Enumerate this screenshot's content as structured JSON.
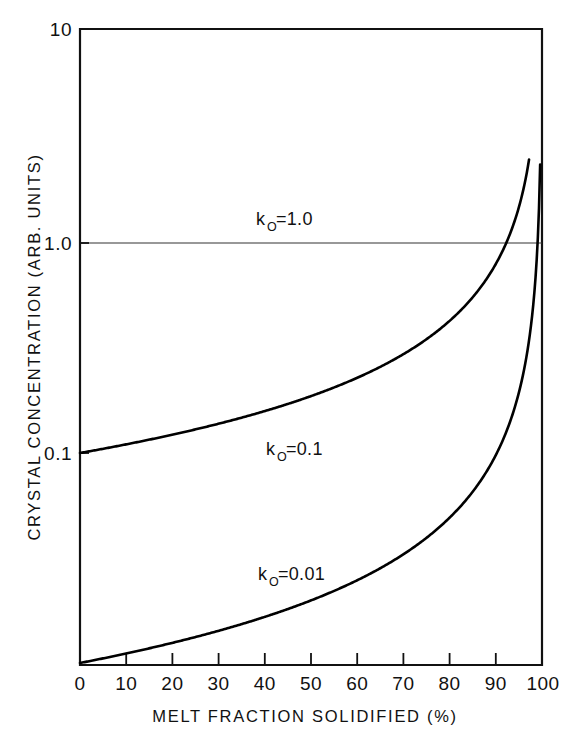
{
  "chart_data": {
    "type": "line",
    "title": "",
    "xlabel": "MELT FRACTION SOLIDIFIED (%)",
    "ylabel": "CRYSTAL CONCENTRATION (ARB. UNITS)",
    "yscale": "log",
    "xscale": "linear",
    "xlim": [
      0,
      100
    ],
    "ylim": [
      0.01,
      10
    ],
    "grid": "horizontal-at-1.0-only",
    "legend_position": "inline-curve-labels",
    "xticks": [
      0,
      10,
      20,
      30,
      40,
      50,
      60,
      70,
      80,
      90,
      100
    ],
    "xtick_labels": [
      "0",
      "10",
      "20",
      "30",
      "40",
      "50",
      "60",
      "70",
      "80",
      "90",
      "100"
    ],
    "yticks": [
      0.1,
      1.0,
      10
    ],
    "ytick_labels": [
      "0.1",
      "1.0",
      "10"
    ],
    "series": [
      {
        "name": "k_0 = 1.0",
        "label": "k",
        "label_sub": "O",
        "label_eq": "=1.0",
        "k0": 1.0,
        "x": [
          0,
          10,
          20,
          30,
          40,
          50,
          60,
          70,
          80,
          90,
          100
        ],
        "values": [
          1.0,
          1.0,
          1.0,
          1.0,
          1.0,
          1.0,
          1.0,
          1.0,
          1.0,
          1.0,
          1.0
        ]
      },
      {
        "name": "k_0 = 0.1",
        "label": "k",
        "label_sub": "O",
        "label_eq": "=0.1",
        "k0": 0.1,
        "x": [
          0,
          10,
          20,
          30,
          40,
          50,
          60,
          70,
          80,
          85,
          90,
          92,
          94,
          96,
          97
        ],
        "values": [
          0.1,
          0.105,
          0.111,
          0.119,
          0.129,
          0.141,
          0.158,
          0.183,
          0.224,
          0.256,
          0.316,
          0.355,
          0.422,
          0.562,
          0.708
        ]
      },
      {
        "name": "k_0 = 0.01",
        "label": "k",
        "label_sub": "O",
        "label_eq": "=0.01",
        "k0": 0.01,
        "x": [
          0,
          10,
          20,
          30,
          40,
          50,
          60,
          70,
          80,
          85,
          90,
          93,
          95,
          97,
          98,
          99,
          99.5
        ],
        "values": [
          0.01,
          0.0105,
          0.0111,
          0.0119,
          0.0129,
          0.0141,
          0.0158,
          0.0183,
          0.0224,
          0.0256,
          0.0316,
          0.0376,
          0.0447,
          0.0577,
          0.0707,
          0.1,
          0.141
        ]
      }
    ],
    "annotations": [
      {
        "text": "k",
        "sub": "O",
        "rest": "=1.0",
        "at_x": 50,
        "at_y_px": 218
      },
      {
        "text": "k",
        "sub": "O",
        "rest": "=0.1",
        "at_x": 50,
        "at_y_px": 448
      },
      {
        "text": "k",
        "sub": "O",
        "rest": "=0.01",
        "at_x": 48,
        "at_y_px": 572
      }
    ]
  },
  "figure": {
    "x_axis_title": "MELT FRACTION SOLIDIFIED (%)",
    "y_axis_title": "CRYSTAL CONCENTRATION (ARB. UNITS)",
    "y_label_top": "10",
    "y_label_mid": "1.0",
    "y_label_low": "0.1",
    "x_label_0": "0",
    "x_label_10": "10",
    "x_label_20": "20",
    "x_label_30": "30",
    "x_label_40": "40",
    "x_label_50": "50",
    "x_label_60": "60",
    "x_label_70": "70",
    "x_label_80": "80",
    "x_label_90": "90",
    "x_label_100": "100",
    "label_k": "k",
    "label_sub": "O",
    "label_eq_1": "=1.0",
    "label_eq_01": "=0.1",
    "label_eq_001": "=0.01"
  }
}
